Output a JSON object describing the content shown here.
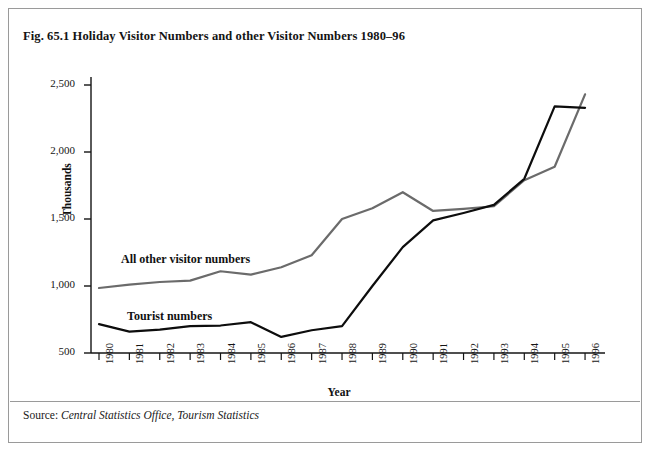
{
  "figure": {
    "title": "Fig. 65.1 Holiday Visitor Numbers and other Visitor Numbers 1980–96",
    "source_label": "Source: ",
    "source_text": "Central Statistics Office, Tourism Statistics",
    "border_color": "#9a9a9a",
    "background": "#ffffff"
  },
  "annotations": {
    "all_other_label": "All other visitor numbers",
    "tourist_label": "Tourist numbers"
  },
  "chart_data": {
    "type": "line",
    "title": "Fig. 65.1 Holiday Visitor Numbers and other Visitor Numbers 1980–96",
    "xlabel": "Year",
    "ylabel": "Thousands",
    "ylim": [
      500,
      2500
    ],
    "yticks": [
      500,
      1000,
      1500,
      2000,
      2500
    ],
    "ytick_labels": [
      "500",
      "1,000",
      "1,500",
      "2,000",
      "2,500"
    ],
    "grid": false,
    "legend": "inline-labels",
    "categories": [
      1980,
      1981,
      1982,
      1983,
      1984,
      1985,
      1986,
      1987,
      1988,
      1989,
      1990,
      1991,
      1992,
      1993,
      1994,
      1995,
      1996
    ],
    "xtick_labels": [
      "1980",
      "1981",
      "1982",
      "1983",
      "1984",
      "1985",
      "1986",
      "1987",
      "1988",
      "1989",
      "1990",
      "1991",
      "1992",
      "1993",
      "1994",
      "1995",
      "1996"
    ],
    "series": [
      {
        "name": "All other visitor numbers",
        "color": "#6b6b6b",
        "width": 2.2,
        "values": [
          985,
          1010,
          1030,
          1040,
          1110,
          1085,
          1140,
          1230,
          1500,
          1580,
          1700,
          1560,
          1575,
          1595,
          1790,
          1890,
          2430
        ]
      },
      {
        "name": "Tourist numbers",
        "color": "#0d0d0d",
        "width": 2.2,
        "values": [
          715,
          660,
          675,
          700,
          705,
          730,
          620,
          670,
          700,
          1000,
          1290,
          1490,
          1545,
          1605,
          1800,
          2340,
          2330
        ]
      }
    ]
  }
}
